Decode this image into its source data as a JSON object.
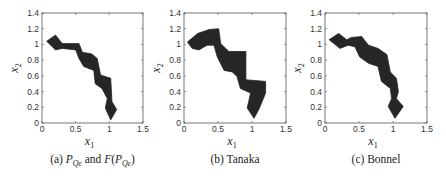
{
  "chart_data": [
    {
      "type": "area",
      "title": "(a) P_Qε and F(P_Qε)",
      "caption_prefix": "(a)",
      "xlabel": "x_1",
      "ylabel": "x_2",
      "xlim": [
        0,
        1.5
      ],
      "ylim": [
        0,
        1.4
      ],
      "xticks": [
        "0",
        "0.5",
        "1",
        "1.5"
      ],
      "yticks": [
        "0",
        "0.2",
        "0.4",
        "0.6",
        "0.8",
        "1",
        "1.2",
        "1.4"
      ],
      "grid": false,
      "fill_color": "#262626",
      "polygon": [
        [
          0.07,
          1.04
        ],
        [
          0.2,
          1.12
        ],
        [
          0.3,
          1.01
        ],
        [
          0.55,
          1.01
        ],
        [
          0.6,
          0.9
        ],
        [
          0.74,
          0.88
        ],
        [
          0.82,
          0.82
        ],
        [
          0.87,
          0.61
        ],
        [
          1.02,
          0.57
        ],
        [
          1.04,
          0.27
        ],
        [
          1.11,
          0.17
        ],
        [
          1.02,
          0.04
        ],
        [
          0.94,
          0.19
        ],
        [
          0.97,
          0.31
        ],
        [
          0.89,
          0.44
        ],
        [
          0.79,
          0.5
        ],
        [
          0.77,
          0.67
        ],
        [
          0.62,
          0.72
        ],
        [
          0.55,
          0.82
        ],
        [
          0.5,
          0.93
        ],
        [
          0.3,
          0.95
        ],
        [
          0.2,
          0.93
        ]
      ]
    },
    {
      "type": "area",
      "title": "(b) Tanaka",
      "xlabel": "x_1",
      "ylabel": "x_2",
      "xlim": [
        0,
        1.5
      ],
      "ylim": [
        0,
        1.4
      ],
      "xticks": [
        "0",
        "0.5",
        "1",
        "1.5"
      ],
      "yticks": [
        "0",
        "0.2",
        "0.4",
        "0.6",
        "0.8",
        "1",
        "1.2",
        "1.4"
      ],
      "grid": false,
      "fill_color": "#262626",
      "polygon": [
        [
          0.05,
          1.03
        ],
        [
          0.2,
          1.14
        ],
        [
          0.37,
          1.19
        ],
        [
          0.51,
          1.2
        ],
        [
          0.54,
          1.01
        ],
        [
          0.66,
          0.91
        ],
        [
          0.91,
          0.91
        ],
        [
          0.91,
          0.55
        ],
        [
          1.2,
          0.53
        ],
        [
          1.2,
          0.38
        ],
        [
          1.1,
          0.17
        ],
        [
          1.03,
          0.06
        ],
        [
          0.93,
          0.19
        ],
        [
          0.98,
          0.38
        ],
        [
          0.83,
          0.44
        ],
        [
          0.78,
          0.59
        ],
        [
          0.71,
          0.65
        ],
        [
          0.59,
          0.67
        ],
        [
          0.49,
          0.84
        ],
        [
          0.44,
          0.99
        ],
        [
          0.34,
          0.99
        ],
        [
          0.22,
          0.93
        ],
        [
          0.12,
          0.95
        ]
      ]
    },
    {
      "type": "area",
      "title": "(c) Bonnel",
      "xlabel": "x_1",
      "ylabel": "x_2",
      "xlim": [
        0,
        1.5
      ],
      "ylim": [
        0,
        1.4
      ],
      "xticks": [
        "0",
        "0.5",
        "1",
        "1.5"
      ],
      "yticks": [
        "0",
        "0.2",
        "0.4",
        "0.6",
        "0.8",
        "1",
        "1.2",
        "1.4"
      ],
      "grid": false,
      "fill_color": "#262626",
      "polygon": [
        [
          0.06,
          1.06
        ],
        [
          0.2,
          1.14
        ],
        [
          0.32,
          1.06
        ],
        [
          0.39,
          1.09
        ],
        [
          0.54,
          1.1
        ],
        [
          0.64,
          0.99
        ],
        [
          0.78,
          0.95
        ],
        [
          0.91,
          0.87
        ],
        [
          0.96,
          0.65
        ],
        [
          1.05,
          0.57
        ],
        [
          1.08,
          0.4
        ],
        [
          1.05,
          0.31
        ],
        [
          1.15,
          0.21
        ],
        [
          1.03,
          0.06
        ],
        [
          0.93,
          0.21
        ],
        [
          0.98,
          0.31
        ],
        [
          0.96,
          0.44
        ],
        [
          0.83,
          0.53
        ],
        [
          0.78,
          0.72
        ],
        [
          0.64,
          0.76
        ],
        [
          0.51,
          0.84
        ],
        [
          0.44,
          0.97
        ],
        [
          0.34,
          0.99
        ],
        [
          0.22,
          0.95
        ]
      ]
    }
  ],
  "panels": [
    {
      "caption_prefix": "(a)",
      "caption_p": "P",
      "caption_sub": "Qε",
      "caption_and": " and ",
      "caption_f": "F",
      "caption_open": "(",
      "caption_close": ")",
      "box": [
        42,
        13,
        143,
        123
      ]
    },
    {
      "caption": "(b) Tanaka",
      "box": [
        184,
        13,
        286,
        123
      ]
    },
    {
      "caption": "(c) Bonnel",
      "box": [
        325,
        13,
        427,
        123
      ]
    }
  ],
  "labels": {
    "x_main": "x",
    "x_sub": "1",
    "y_main": "x",
    "y_sub": "2"
  }
}
